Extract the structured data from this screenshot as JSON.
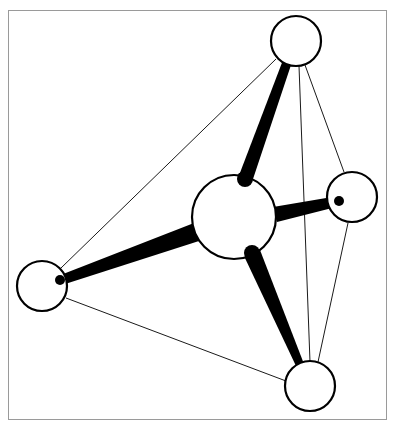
{
  "diagram": {
    "title": "",
    "colors": {
      "background": "#ffffff",
      "frame": "#9a9a9a",
      "atom_fill": "#ffffff",
      "atom_stroke": "#000000",
      "bond": "#000000",
      "edge": "#1a1a1a"
    },
    "frame": {
      "x": 8,
      "y": 10,
      "width": 378,
      "height": 409
    },
    "atoms": [
      {
        "id": "center",
        "role": "central-atom",
        "cx": 234,
        "cy": 217,
        "r": 42
      },
      {
        "id": "top",
        "role": "outer-atom",
        "cx": 296,
        "cy": 41,
        "r": 25
      },
      {
        "id": "right",
        "role": "outer-atom",
        "cx": 352,
        "cy": 197,
        "r": 25
      },
      {
        "id": "left",
        "role": "outer-atom",
        "cx": 42,
        "cy": 286,
        "r": 25
      },
      {
        "id": "bottom",
        "role": "outer-atom",
        "cx": 310,
        "cy": 386,
        "r": 25
      }
    ],
    "bonds": [
      {
        "from": "center",
        "to": "top",
        "points": "238,178 252,182 292,62 283,60",
        "cap": {
          "cx": 245,
          "cy": 179,
          "r": 8
        }
      },
      {
        "from": "center",
        "to": "right",
        "points": "273,207 277,222 340,206 338,196",
        "cap": {
          "cx": 339,
          "cy": 201,
          "r": 5
        }
      },
      {
        "from": "center",
        "to": "left",
        "points": "194,223 199,241 62,285 58,276",
        "cap": {
          "cx": 60,
          "cy": 280,
          "r": 5
        }
      },
      {
        "from": "center",
        "to": "bottom",
        "points": "244,256 260,250 304,364 296,366",
        "cap": {
          "cx": 252,
          "cy": 253,
          "r": 8
        }
      }
    ],
    "edges": [
      {
        "from": "top",
        "to": "left",
        "x1": 276,
        "y1": 59,
        "x2": 61,
        "y2": 268
      },
      {
        "from": "top",
        "to": "right",
        "x1": 305,
        "y1": 65,
        "x2": 344,
        "y2": 172
      },
      {
        "from": "top",
        "to": "bottom",
        "x1": 299,
        "y1": 66,
        "x2": 310,
        "y2": 362
      },
      {
        "from": "right",
        "to": "bottom",
        "x1": 348,
        "y1": 223,
        "x2": 318,
        "y2": 362
      },
      {
        "from": "left",
        "to": "bottom",
        "x1": 66,
        "y1": 298,
        "x2": 286,
        "y2": 381
      }
    ]
  }
}
